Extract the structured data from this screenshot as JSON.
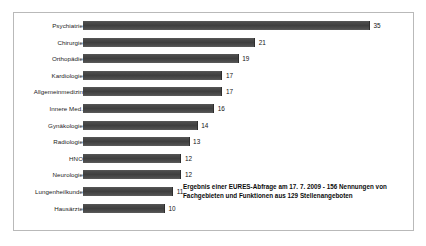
{
  "chart_data": {
    "type": "bar",
    "orientation": "horizontal",
    "title": "",
    "subtitle": "",
    "xlabel": "",
    "ylabel": "",
    "grid": false,
    "legend": "none",
    "xlim": [
      0,
      40
    ],
    "categories": [
      "Psychiatrie",
      "Chirurgie",
      "Orthopädie",
      "Kardiologie",
      "Allgemeinmedizin",
      "Innere Med.",
      "Gynäkologie",
      "Radiologie",
      "HNO",
      "Neurologie",
      "Lungenheilkunde",
      "Hausärzte"
    ],
    "values": [
      35,
      21,
      19,
      17,
      17,
      16,
      14,
      13,
      12,
      12,
      11,
      10
    ],
    "bar_color": "#464646",
    "annotation_lines": [
      "Ergebnis einer EURES-Abfrage am 17. 7. 2009 - 156 Nennungen von",
      "Fachgebieten und Funktionen aus 129 Stellenangeboten"
    ]
  },
  "annotation": {
    "line1": "Ergebnis einer EURES-Abfrage am 17. 7. 2009 - 156 Nennungen von",
    "line2": "Fachgebieten und Funktionen aus 129 Stellenangeboten"
  },
  "frame": {
    "border_color": "#b9b9b9",
    "background": "#ffffff"
  }
}
